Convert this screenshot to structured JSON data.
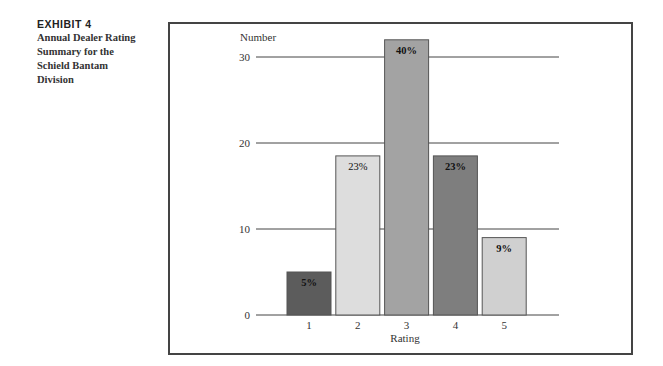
{
  "caption": {
    "exhibit": "EXHIBIT 4",
    "title_lines": [
      "Annual Dealer Rating",
      "Summary for the",
      "Schield Bantam",
      "Division"
    ]
  },
  "chart_data": {
    "type": "bar",
    "title": "Annual Dealer Rating Summary for the Schield Bantam Division",
    "xlabel": "Rating",
    "ylabel": "Number",
    "categories": [
      "1",
      "2",
      "3",
      "4",
      "5"
    ],
    "values": [
      5,
      18.5,
      32,
      18.5,
      9
    ],
    "data_labels": [
      "5%",
      "23%",
      "40%",
      "23%",
      "9%"
    ],
    "yticks": [
      0,
      10,
      20,
      30
    ],
    "ylim": [
      0,
      33
    ],
    "grid": true,
    "legend": null,
    "bar_colors": [
      "#5c5c5c",
      "#dddddd",
      "#a3a3a3",
      "#7e7e7e",
      "#d0d0d0"
    ]
  }
}
